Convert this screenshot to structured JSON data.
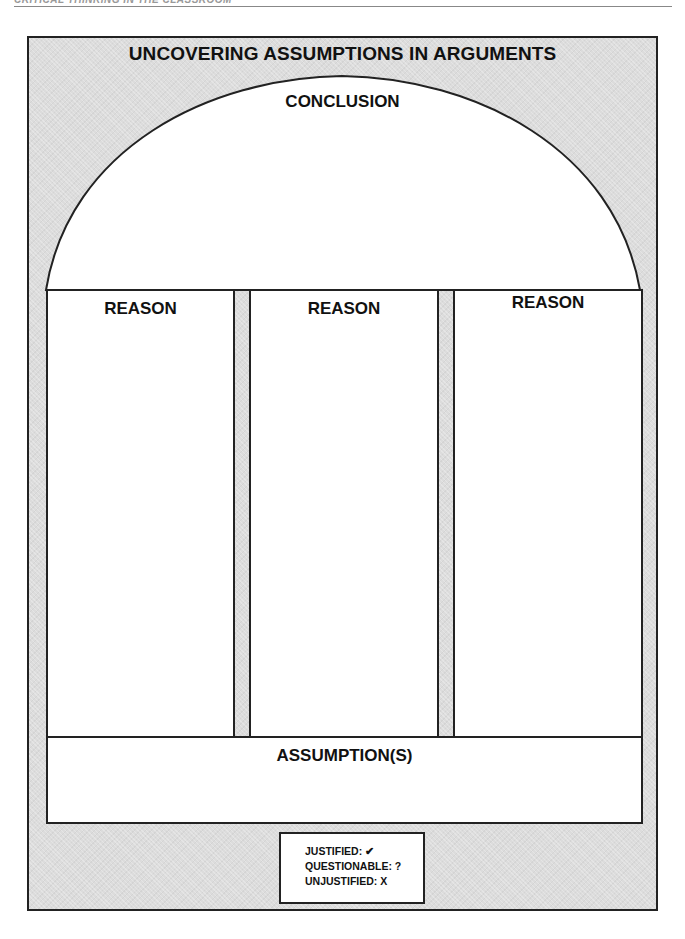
{
  "page_header": {
    "text": "CRITICAL THINKING IN THE CLASSROOM"
  },
  "worksheet": {
    "title": "UNCOVERING ASSUMPTIONS IN ARGUMENTS",
    "conclusion": {
      "label": "CONCLUSION",
      "value": ""
    },
    "reasons": [
      {
        "label": "REASON",
        "value": ""
      },
      {
        "label": "REASON",
        "value": ""
      },
      {
        "label": "REASON",
        "value": ""
      }
    ],
    "assumptions": {
      "label": "ASSUMPTION(S)",
      "value": ""
    },
    "legend": [
      {
        "label": "JUSTIFIED:",
        "symbol": "✔"
      },
      {
        "label": "QUESTIONABLE:",
        "symbol": "?"
      },
      {
        "label": "UNJUSTIFIED:",
        "symbol": "X"
      }
    ]
  },
  "colors": {
    "frame_fill": "#dcdcdc",
    "border": "#222222",
    "box_fill": "#ffffff"
  }
}
